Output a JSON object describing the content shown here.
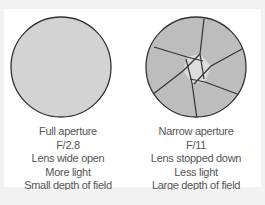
{
  "diagram": {
    "colors": {
      "background": "#f2f2f2",
      "panel": "#ffffff",
      "disc_fill": "#d3d3d3",
      "blade_fill": "#bdbdbd",
      "opening_fill": "#dcdcdc",
      "outline": "#333333",
      "text": "#555555"
    },
    "left": {
      "lines": [
        "Full aperture",
        "F/2.8",
        "Lens wide open",
        "More light",
        "Small depth of field"
      ]
    },
    "right": {
      "lines": [
        "Narrow aperture",
        "F/11",
        "Lens stopped down",
        "Less light",
        "Large depth of field"
      ]
    }
  }
}
